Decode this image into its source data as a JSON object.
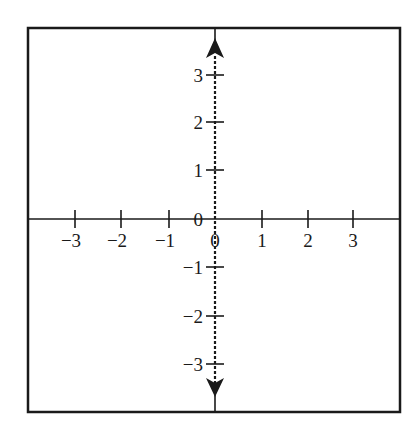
{
  "diagram": {
    "type": "coordinate-plane",
    "frame": {
      "x1": 28,
      "y1": 28,
      "x2": 400,
      "y2": 412,
      "stroke": "#1a1a1a"
    },
    "origin": {
      "x": 215,
      "y": 219
    },
    "x_axis": {
      "ticks": [
        {
          "value": -3,
          "label": "−3",
          "x": 75
        },
        {
          "value": -2,
          "label": "−2",
          "x": 121
        },
        {
          "value": -1,
          "label": "−1",
          "x": 169
        },
        {
          "value": 0,
          "label": "0",
          "x": 215
        },
        {
          "value": 1,
          "label": "1",
          "x": 262
        },
        {
          "value": 2,
          "label": "2",
          "x": 308
        },
        {
          "value": 3,
          "label": "3",
          "x": 353
        }
      ]
    },
    "y_axis": {
      "style": "dashed-with-arrows",
      "ticks": [
        {
          "value": 3,
          "label": "3",
          "y": 75
        },
        {
          "value": 2,
          "label": "2",
          "y": 122
        },
        {
          "value": 1,
          "label": "1",
          "y": 170
        },
        {
          "value": 0,
          "label": "0",
          "y": 219
        },
        {
          "value": -1,
          "label": "−1",
          "y": 267
        },
        {
          "value": -2,
          "label": "−2",
          "y": 316
        },
        {
          "value": -3,
          "label": "−3",
          "y": 364
        }
      ]
    },
    "line_color": "#1a1a1a"
  }
}
